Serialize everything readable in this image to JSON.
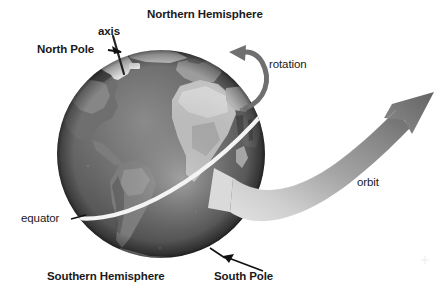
{
  "figure": {
    "background_color": "#ffffff",
    "width": 448,
    "height": 302
  },
  "labels": {
    "northern_hemisphere": "Northern Hemisphere",
    "axis": "axis",
    "north_pole": "North Pole",
    "rotation": "rotation",
    "orbit": "orbit",
    "equator": "equator",
    "southern_hemisphere": "Southern Hemisphere",
    "south_pole": "South Pole"
  },
  "colors": {
    "text": "#1a1a1a",
    "ocean_dark": "#4a4a4a",
    "ocean_mid": "#5e5e5e",
    "land_light": "#b9b9b9",
    "land_mid": "#8d8d8d",
    "ice_white": "#ededed",
    "equator_line": "#f2f2f2",
    "axis_line": "#2b2b2b",
    "arrow_dark": "#6b6b6b",
    "orbit_light": "#cfcfcf",
    "orbit_dark": "#6e6e6e"
  },
  "globe": {
    "center_x": 161,
    "center_y": 154,
    "radius": 104,
    "tilt_degrees": 23.5
  },
  "annotations": [
    {
      "name": "north-pole-pointer",
      "from": [
        110,
        50
      ],
      "to": [
        121,
        56
      ],
      "style": "arrow"
    },
    {
      "name": "axis-pointer",
      "from": [
        112,
        40
      ],
      "to": [
        120,
        62
      ],
      "style": "line"
    },
    {
      "name": "south-pole-pointer",
      "from": [
        264,
        272
      ],
      "to": [
        222,
        256
      ],
      "style": "arrow"
    },
    {
      "name": "equator-pointer",
      "from": [
        70,
        219
      ],
      "to": [
        83,
        216
      ],
      "style": "line"
    },
    {
      "name": "rotation-arc",
      "description": "curved arrow over north pole pointing west"
    },
    {
      "name": "orbit-ribbon",
      "description": "wide tapering ribbon arrow sweeping right and up"
    }
  ]
}
